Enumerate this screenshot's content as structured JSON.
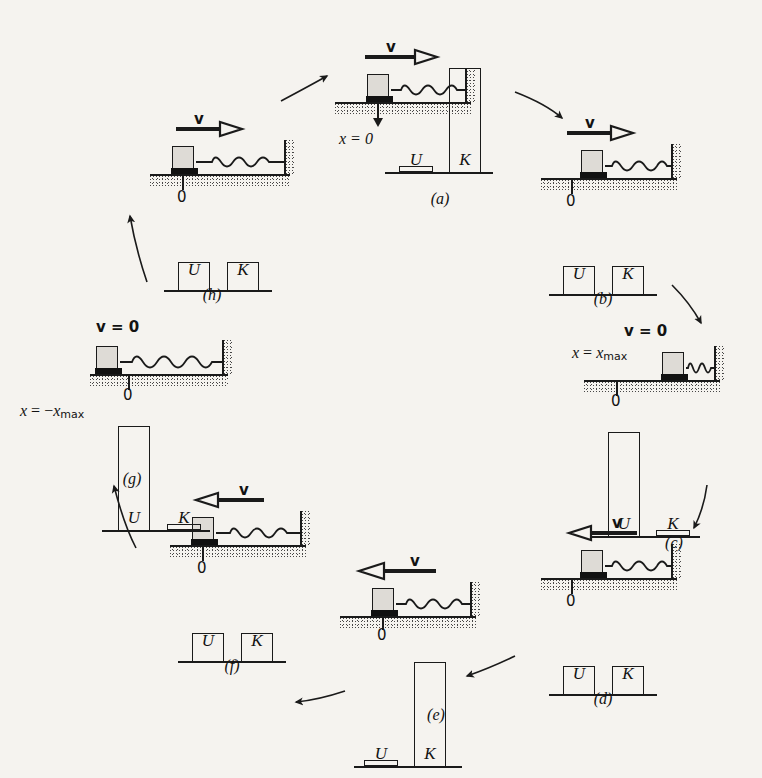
{
  "figure": {
    "background_color": "#f5f3ef",
    "ink_color": "#1a1a1a",
    "block_fill": "#dedbd6"
  },
  "bar_labels": {
    "u": "U",
    "k": "K"
  },
  "panels": [
    {
      "id": "a",
      "caption": "(a)",
      "velocity_label": "v",
      "velocity_direction": "right",
      "velocity_zero": false,
      "position_label": "x = 0",
      "position_label_parts": {
        "var": "x",
        "eq": "=",
        "value": "0"
      },
      "origin_label": "0",
      "block_position": "origin",
      "spring_state": "natural",
      "bars": {
        "U": 5,
        "K": 100
      }
    },
    {
      "id": "b",
      "caption": "(b)",
      "velocity_label": "v",
      "velocity_direction": "right",
      "velocity_zero": false,
      "position_label": "",
      "origin_label": "0",
      "block_position": "right-of-origin",
      "spring_state": "compressed-slightly",
      "bars": {
        "U": 50,
        "K": 50
      }
    },
    {
      "id": "c",
      "caption": "(c)",
      "velocity_label": "v = 0",
      "velocity_direction": "none",
      "velocity_zero": true,
      "position_label": "x = xmax",
      "position_label_parts": {
        "var": "x",
        "eq": "=",
        "value": "x",
        "sub": "max",
        "sign": ""
      },
      "origin_label": "0",
      "block_position": "max-right",
      "spring_state": "fully-compressed",
      "bars": {
        "U": 100,
        "K": 5
      }
    },
    {
      "id": "d",
      "caption": "(d)",
      "velocity_label": "v",
      "velocity_direction": "left",
      "velocity_zero": false,
      "position_label": "",
      "origin_label": "0",
      "block_position": "right-of-origin",
      "spring_state": "compressed-slightly",
      "bars": {
        "U": 50,
        "K": 50
      }
    },
    {
      "id": "e",
      "caption": "(e)",
      "velocity_label": "v",
      "velocity_direction": "left",
      "velocity_zero": false,
      "position_label": "",
      "origin_label": "0",
      "block_position": "origin",
      "spring_state": "natural",
      "bars": {
        "U": 5,
        "K": 100
      }
    },
    {
      "id": "f",
      "caption": "(f)",
      "velocity_label": "v",
      "velocity_direction": "left",
      "velocity_zero": false,
      "position_label": "",
      "origin_label": "0",
      "block_position": "left-of-origin",
      "spring_state": "stretched-slightly",
      "bars": {
        "U": 50,
        "K": 50
      }
    },
    {
      "id": "g",
      "caption": "(g)",
      "velocity_label": "v = 0",
      "velocity_direction": "none",
      "velocity_zero": true,
      "position_label": "x = -xmax",
      "position_label_parts": {
        "var": "x",
        "eq": "=",
        "sign": "−",
        "value": "x",
        "sub": "max"
      },
      "origin_label": "0",
      "block_position": "max-left",
      "spring_state": "fully-stretched",
      "bars": {
        "U": 100,
        "K": 5
      }
    },
    {
      "id": "h",
      "caption": "(h)",
      "velocity_label": "v",
      "velocity_direction": "right",
      "velocity_zero": false,
      "position_label": "",
      "origin_label": "0",
      "block_position": "left-of-origin",
      "spring_state": "stretched-slightly",
      "bars": {
        "U": 50,
        "K": 50
      }
    }
  ],
  "flow_arrows": [
    {
      "from": "h",
      "to": "a",
      "direction": "up-right"
    },
    {
      "from": "a",
      "to": "b",
      "direction": "down-right"
    },
    {
      "from": "b",
      "to": "c",
      "direction": "down-right"
    },
    {
      "from": "c",
      "to": "d",
      "direction": "down"
    },
    {
      "from": "d",
      "to": "e",
      "direction": "down-left"
    },
    {
      "from": "e",
      "to": "f",
      "direction": "left"
    },
    {
      "from": "f",
      "to": "g",
      "direction": "up-left"
    },
    {
      "from": "g",
      "to": "h",
      "direction": "up-right"
    }
  ],
  "chart_data": {
    "type": "bar",
    "categories": [
      "U",
      "K"
    ],
    "ylabel": "Energy (fraction of total mechanical energy, %)",
    "ylim": [
      0,
      100
    ],
    "grid": false,
    "legend": "none",
    "series": [
      {
        "name": "(a) x = 0, v right",
        "values": [
          5,
          100
        ]
      },
      {
        "name": "(b) x > 0, v right",
        "values": [
          50,
          50
        ]
      },
      {
        "name": "(c) x = xmax, v = 0",
        "values": [
          100,
          5
        ]
      },
      {
        "name": "(d) x > 0, v left",
        "values": [
          50,
          50
        ]
      },
      {
        "name": "(e) x = 0, v left",
        "values": [
          5,
          100
        ]
      },
      {
        "name": "(f) x < 0, v left",
        "values": [
          50,
          50
        ]
      },
      {
        "name": "(g) x = -xmax, v = 0",
        "values": [
          100,
          5
        ]
      },
      {
        "name": "(h) x < 0, v right",
        "values": [
          50,
          50
        ]
      }
    ]
  }
}
